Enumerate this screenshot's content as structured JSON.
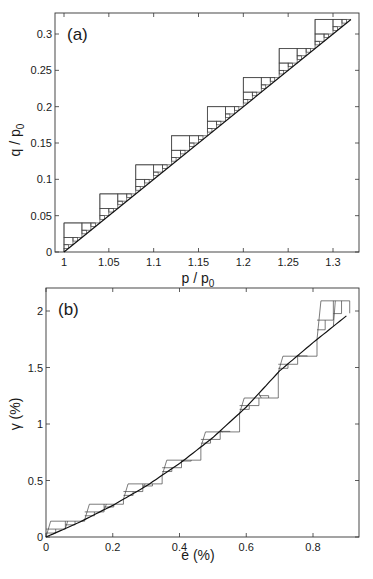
{
  "chart_data": [
    {
      "type": "line",
      "panel_label": "(a)",
      "title": "",
      "xlabel": "p / p",
      "xlabel_sub": "0",
      "ylabel": "q / p",
      "ylabel_sub": "0",
      "xlim": [
        0.99,
        1.33
      ],
      "ylim": [
        0,
        0.33
      ],
      "xticks": [
        1,
        1.05,
        1.1,
        1.15,
        1.2,
        1.25,
        1.3
      ],
      "xtick_labels": [
        "1",
        "1.05",
        "1.1",
        "1.15",
        "1.2",
        "1.25",
        "1.3"
      ],
      "yticks": [
        0,
        0.05,
        0.1,
        0.15,
        0.2,
        0.25,
        0.3
      ],
      "ytick_labels": [
        "0",
        "0.05",
        "0.1",
        "0.15",
        "0.2",
        "0.25",
        "0.3"
      ],
      "grid": false,
      "series": [
        {
          "name": "boundary line",
          "x": [
            1.0,
            1.32
          ],
          "y": [
            0.0,
            0.32
          ]
        }
      ],
      "staircase": {
        "step_width": 0.04,
        "step_count": 8,
        "step_starts_p": [
          1.0,
          1.04,
          1.08,
          1.12,
          1.16,
          1.2,
          1.24,
          1.28
        ],
        "step_tops_q": [
          0.04,
          0.08,
          0.12,
          0.16,
          0.2,
          0.24,
          0.28,
          0.32
        ]
      }
    },
    {
      "type": "line",
      "panel_label": "(b)",
      "title": "",
      "xlabel": "e (%)",
      "ylabel": "γ (%)",
      "xlim": [
        0,
        0.937
      ],
      "ylim": [
        0,
        2.2
      ],
      "xticks": [
        0,
        0.2,
        0.4,
        0.6,
        0.8
      ],
      "xtick_labels": [
        "0",
        "0.2",
        "0.4",
        "0.6",
        "0.8"
      ],
      "yticks": [
        0,
        0.5,
        1,
        1.5,
        2
      ],
      "ytick_labels": [
        "0",
        "0.5",
        "1",
        "1.5",
        "2"
      ],
      "grid": false,
      "series": [
        {
          "name": "boundary curve",
          "x": [
            0,
            0.1,
            0.2,
            0.3,
            0.4,
            0.5,
            0.6,
            0.7,
            0.8,
            0.91
          ],
          "y": [
            0,
            0.13,
            0.28,
            0.45,
            0.65,
            0.88,
            1.15,
            1.47,
            1.72,
            1.98
          ]
        }
      ],
      "staircase": {
        "step_count": 8,
        "step_starts_e": [
          0.0,
          0.116,
          0.232,
          0.348,
          0.464,
          0.58,
          0.696,
          0.812
        ],
        "step_ends_e": [
          0.116,
          0.232,
          0.348,
          0.464,
          0.58,
          0.696,
          0.812,
          0.91
        ],
        "step_tops_gamma": [
          0.14,
          0.29,
          0.47,
          0.68,
          0.93,
          1.23,
          1.6,
          2.09
        ]
      }
    }
  ]
}
